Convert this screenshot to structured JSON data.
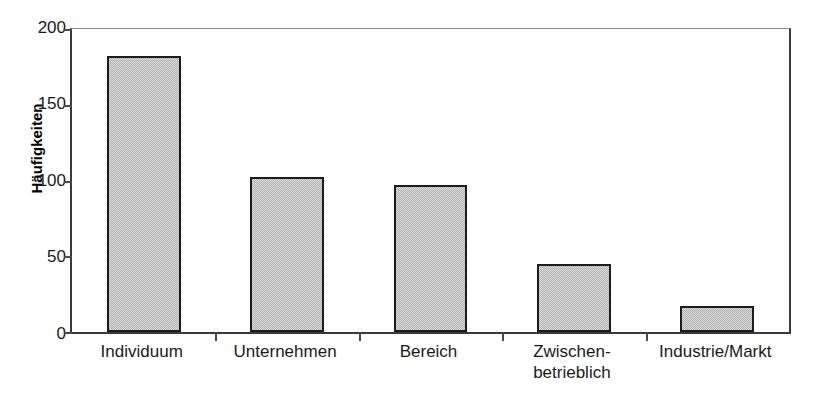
{
  "chart_data": {
    "type": "bar",
    "title": "",
    "subtitle": "",
    "xlabel": "",
    "ylabel": "Häufigkeiten",
    "categories": [
      "Individuum",
      "Unternehmen",
      "Bereich",
      "Zwischen-\nbetrieblich",
      "Industrie/Markt"
    ],
    "category_lines": [
      [
        "Individuum"
      ],
      [
        "Unternehmen"
      ],
      [
        "Bereich"
      ],
      [
        "Zwischen-",
        "betrieblich"
      ],
      [
        "Industrie/Markt"
      ]
    ],
    "values": [
      182,
      102,
      97,
      45,
      17
    ],
    "ylim": [
      0,
      200
    ],
    "yticks": [
      0,
      50,
      100,
      150,
      200
    ],
    "ytick_labels": [
      "0",
      "50",
      "100",
      "150",
      "200"
    ],
    "grid": false,
    "legend": null,
    "legend_position": "none",
    "bar_fill_color": "#b4b4b4",
    "bar_edge_color": "#1c1c1c",
    "axis_color": "#3a3a3a",
    "text_color": "#1a1a1a",
    "background_color": "#ffffff",
    "annotations": []
  }
}
